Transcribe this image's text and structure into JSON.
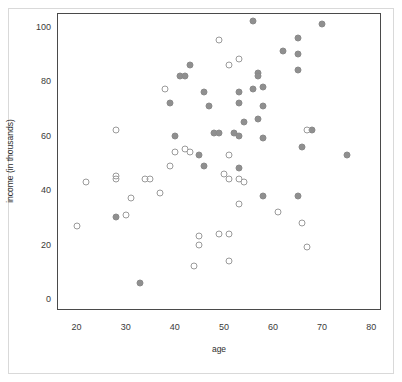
{
  "chart_data": {
    "type": "scatter",
    "title": "",
    "xlabel": "age",
    "ylabel": "income (in thousands)",
    "xlim": [
      16,
      82
    ],
    "ylim": [
      -4,
      105
    ],
    "xticks": [
      20,
      30,
      40,
      50,
      60,
      70,
      80
    ],
    "yticks": [
      0,
      20,
      40,
      60,
      80,
      100
    ],
    "grid": false,
    "legend": null,
    "colors": {
      "filled_marker": "#8f8f8f",
      "open_marker_edge": "#9a9a9a",
      "plot_frame": "#4a4a4a",
      "outer_frame": "#d9d9d9",
      "text": "#2e2e2e"
    },
    "series": [
      {
        "name": "filled",
        "marker": "filled-circle",
        "points": [
          [
            56,
            102
          ],
          [
            70,
            101
          ],
          [
            65,
            96
          ],
          [
            62,
            91
          ],
          [
            65,
            90
          ],
          [
            43,
            86
          ],
          [
            65,
            84
          ],
          [
            57,
            83
          ],
          [
            57,
            82
          ],
          [
            41,
            82
          ],
          [
            42,
            82
          ],
          [
            58,
            78
          ],
          [
            56,
            77
          ],
          [
            46,
            76
          ],
          [
            53,
            76
          ],
          [
            39,
            72
          ],
          [
            53,
            72
          ],
          [
            47,
            71
          ],
          [
            58,
            71
          ],
          [
            54,
            65
          ],
          [
            57,
            66
          ],
          [
            48,
            61
          ],
          [
            52,
            61
          ],
          [
            49,
            61
          ],
          [
            40,
            60
          ],
          [
            53,
            60
          ],
          [
            58,
            59
          ],
          [
            68,
            62
          ],
          [
            66,
            56
          ],
          [
            75,
            53
          ],
          [
            45,
            53
          ],
          [
            46,
            49
          ],
          [
            53,
            48
          ],
          [
            58,
            38
          ],
          [
            65,
            38
          ],
          [
            28,
            30
          ],
          [
            33,
            6
          ]
        ]
      },
      {
        "name": "open",
        "marker": "open-circle",
        "points": [
          [
            49,
            95
          ],
          [
            51,
            86
          ],
          [
            53,
            88
          ],
          [
            28,
            62
          ],
          [
            67,
            62
          ],
          [
            38,
            77
          ],
          [
            40,
            54
          ],
          [
            42,
            55
          ],
          [
            43,
            54
          ],
          [
            51,
            53
          ],
          [
            39,
            49
          ],
          [
            50,
            46
          ],
          [
            51,
            44
          ],
          [
            53,
            44
          ],
          [
            54,
            43
          ],
          [
            28,
            45
          ],
          [
            28,
            44
          ],
          [
            30,
            31
          ],
          [
            31,
            37
          ],
          [
            34,
            44
          ],
          [
            35,
            44
          ],
          [
            37,
            39
          ],
          [
            22,
            43
          ],
          [
            20,
            27
          ],
          [
            61,
            32
          ],
          [
            66,
            28
          ],
          [
            53,
            35
          ],
          [
            67,
            19
          ],
          [
            49,
            24
          ],
          [
            51,
            24
          ],
          [
            45,
            23
          ],
          [
            45,
            20
          ],
          [
            44,
            12
          ],
          [
            51,
            14
          ]
        ]
      }
    ]
  },
  "axes": {
    "x_tick_labels": [
      "20",
      "30",
      "40",
      "50",
      "60",
      "70",
      "80"
    ],
    "y_tick_labels": [
      "0",
      "20",
      "40",
      "60",
      "80",
      "100"
    ],
    "x_axis_title": "age",
    "y_axis_title": "income (in thousands)"
  }
}
